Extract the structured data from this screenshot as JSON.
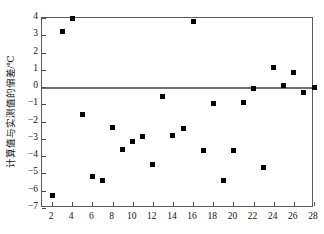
{
  "chart_data": {
    "type": "scatter",
    "title": "",
    "xlabel": "",
    "ylabel": "计算值与实测值的偏差/℃",
    "xlim": [
      1,
      28
    ],
    "ylim": [
      -7,
      4
    ],
    "grid": false,
    "legend": null,
    "zero_reference_line": 0,
    "xticks": [
      2,
      4,
      6,
      8,
      10,
      12,
      14,
      16,
      18,
      20,
      22,
      24,
      26,
      28
    ],
    "yticks": [
      4,
      3,
      2,
      1,
      0,
      -1,
      -2,
      -3,
      -4,
      -5,
      -6,
      -7
    ],
    "xtick_labels": [
      "2",
      "4",
      "6",
      "8",
      "10",
      "12",
      "14",
      "16",
      "18",
      "20",
      "22",
      "24",
      "26",
      "28"
    ],
    "ytick_labels": [
      "4",
      "3",
      "2",
      "1",
      "0",
      "−1",
      "−2",
      "−3",
      "−4",
      "−5",
      "−6",
      "−7"
    ],
    "marker": "square",
    "marker_color": "#000000",
    "points": [
      {
        "x": 2,
        "y": -6.25
      },
      {
        "x": 3,
        "y": 3.2
      },
      {
        "x": 4,
        "y": 3.95
      },
      {
        "x": 5,
        "y": -1.6
      },
      {
        "x": 6,
        "y": -5.2
      },
      {
        "x": 7,
        "y": -5.4
      },
      {
        "x": 8,
        "y": -2.35
      },
      {
        "x": 9,
        "y": -3.6
      },
      {
        "x": 10,
        "y": -3.15
      },
      {
        "x": 11,
        "y": -2.85
      },
      {
        "x": 12,
        "y": -4.5
      },
      {
        "x": 13,
        "y": -0.55
      },
      {
        "x": 14,
        "y": -2.8
      },
      {
        "x": 15,
        "y": -2.4
      },
      {
        "x": 16,
        "y": 3.8
      },
      {
        "x": 17,
        "y": -3.68
      },
      {
        "x": 18,
        "y": -0.95
      },
      {
        "x": 19,
        "y": -5.38
      },
      {
        "x": 20,
        "y": -3.65
      },
      {
        "x": 21,
        "y": -0.9
      },
      {
        "x": 22,
        "y": -0.1
      },
      {
        "x": 23,
        "y": -4.68
      },
      {
        "x": 24,
        "y": 1.12
      },
      {
        "x": 25,
        "y": 0.08
      },
      {
        "x": 26,
        "y": 0.85
      },
      {
        "x": 27,
        "y": -0.32
      },
      {
        "x": 28,
        "y": -0.05
      }
    ]
  }
}
